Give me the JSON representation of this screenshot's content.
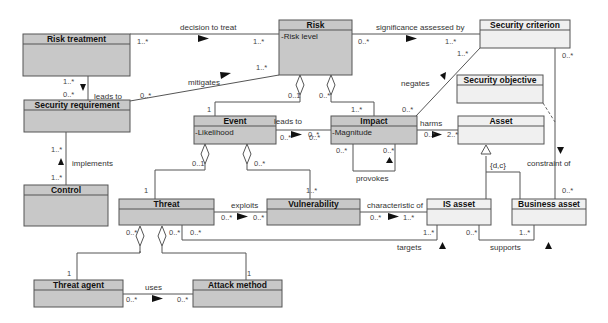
{
  "diagram": {
    "type": "UML class diagram",
    "colors": {
      "dark_class": "#c8c8c8",
      "light_class": "#f0f0f0",
      "border": "#555555",
      "line": "#555555"
    },
    "classes": [
      {
        "id": "risk_treatment",
        "name": "Risk treatment",
        "attr": "",
        "shade": "dark",
        "x": 23,
        "y": 34,
        "w": 107,
        "h": 42
      },
      {
        "id": "risk",
        "name": "Risk",
        "attr": "-Risk level",
        "shade": "dark",
        "x": 279,
        "y": 20,
        "w": 73,
        "h": 55
      },
      {
        "id": "security_criterion",
        "name": "Security criterion",
        "attr": "",
        "shade": "light",
        "x": 480,
        "y": 20,
        "w": 90,
        "h": 28
      },
      {
        "id": "security_requirement",
        "name": "Security requirement",
        "attr": "",
        "shade": "dark",
        "x": 24,
        "y": 100,
        "w": 106,
        "h": 32
      },
      {
        "id": "security_objective",
        "name": "Security objective",
        "attr": "",
        "shade": "light",
        "x": 457,
        "y": 75,
        "w": 86,
        "h": 28
      },
      {
        "id": "event",
        "name": "Event",
        "attr": "-Likelihood",
        "shade": "dark",
        "x": 194,
        "y": 116,
        "w": 82,
        "h": 28
      },
      {
        "id": "impact",
        "name": "Impact",
        "attr": "-Magnitude",
        "shade": "dark",
        "x": 331,
        "y": 116,
        "w": 86,
        "h": 28
      },
      {
        "id": "asset",
        "name": "Asset",
        "attr": "",
        "shade": "light",
        "x": 458,
        "y": 116,
        "w": 86,
        "h": 28
      },
      {
        "id": "control",
        "name": "Control",
        "attr": "",
        "shade": "dark",
        "x": 24,
        "y": 185,
        "w": 84,
        "h": 41
      },
      {
        "id": "threat",
        "name": "Threat",
        "attr": "",
        "shade": "dark",
        "x": 119,
        "y": 199,
        "w": 95,
        "h": 26
      },
      {
        "id": "vulnerability",
        "name": "Vulnerability",
        "attr": "",
        "shade": "dark",
        "x": 267,
        "y": 199,
        "w": 93,
        "h": 26
      },
      {
        "id": "is_asset",
        "name": "IS asset",
        "attr": "",
        "shade": "light",
        "x": 427,
        "y": 199,
        "w": 64,
        "h": 26
      },
      {
        "id": "business_asset",
        "name": "Business asset",
        "attr": "",
        "shade": "light",
        "x": 512,
        "y": 199,
        "w": 74,
        "h": 26
      },
      {
        "id": "threat_agent",
        "name": "Threat agent",
        "attr": "",
        "shade": "dark",
        "x": 34,
        "y": 280,
        "w": 89,
        "h": 27
      },
      {
        "id": "attack_method",
        "name": "Attack method",
        "attr": "",
        "shade": "dark",
        "x": 193,
        "y": 280,
        "w": 89,
        "h": 27
      }
    ],
    "associations": [
      {
        "label": "decision to treat",
        "from": "Risk treatment",
        "to": "Risk",
        "m1": "1..*",
        "m2": "1..*"
      },
      {
        "label": "significance assessed by",
        "from": "Risk",
        "to": "Security criterion",
        "m1": "0..*",
        "m2": "1..*"
      },
      {
        "label": "mitigates",
        "from": "Security requirement",
        "to": "Risk",
        "m1": "0..*",
        "m2": "1..*"
      },
      {
        "label": "leads to",
        "from": "Risk treatment",
        "to": "Security requirement",
        "m1": "1..*",
        "m2": "0..*"
      },
      {
        "label": "implements",
        "from": "Control",
        "to": "Security requirement",
        "m1": "1..*",
        "m2": "1..*"
      },
      {
        "label": "negates",
        "from": "Impact",
        "to": "Security criterion",
        "m1": "0..*",
        "m2": "1..*"
      },
      {
        "label": "leads to",
        "from": "Event",
        "to": "Impact",
        "m1": "0..*",
        "m2": "0..*"
      },
      {
        "label": "harms",
        "from": "Impact",
        "to": "Asset",
        "m1": "0..*",
        "m2": "2..*"
      },
      {
        "label": "provokes",
        "from": "Impact",
        "to": "Impact",
        "m1": "0..*",
        "m2": "0..*"
      },
      {
        "label": "constraint of",
        "from": "Security criterion",
        "to": "Business asset",
        "m1": "0..*",
        "m2": "0..*"
      },
      {
        "label": "exploits",
        "from": "Threat",
        "to": "Vulnerability",
        "m1": "0..*",
        "m2": "0..*"
      },
      {
        "label": "characteristic of",
        "from": "Vulnerability",
        "to": "IS asset",
        "m1": "0..*",
        "m2": "1..*"
      },
      {
        "label": "targets",
        "from": "Threat",
        "to": "IS asset",
        "m1": "0..*",
        "m2": "1..*"
      },
      {
        "label": "supports",
        "from": "IS asset",
        "to": "Business asset",
        "m1": "0..*",
        "m2": "1..*"
      },
      {
        "label": "uses",
        "from": "Threat agent",
        "to": "Attack method",
        "m1": "0..*",
        "m2": "0..*"
      }
    ],
    "aggregations": [
      {
        "whole": "Risk",
        "part": "Event",
        "m_whole": "0..1",
        "m_part": "1"
      },
      {
        "whole": "Risk",
        "part": "Impact",
        "m_whole": "0..*",
        "m_part": "1..*"
      },
      {
        "whole": "Event",
        "part": "Threat",
        "m_whole": "0..1",
        "m_part": "1"
      },
      {
        "whole": "Event",
        "part": "Vulnerability",
        "m_whole": "0..*",
        "m_part": "1..*"
      },
      {
        "whole": "Threat",
        "part": "Threat agent",
        "m_whole": "0..*",
        "m_part": "1"
      },
      {
        "whole": "Threat",
        "part": "Attack method",
        "m_whole": "0..*",
        "m_part": "1"
      }
    ],
    "generalization": {
      "parent": "Asset",
      "children": [
        "IS asset",
        "Business asset"
      ],
      "constraint": "{d,c}"
    }
  },
  "labels": {
    "decision_to_treat": "decision to treat",
    "significance": "significance assessed by",
    "mitigates": "mitigates",
    "leads_to_1": "leads to",
    "implements": "implements",
    "negates": "negates",
    "leads_to_2": "leads to",
    "harms": "harms",
    "provokes": "provokes",
    "constraint_of": "constraint of",
    "exploits": "exploits",
    "characteristic_of": "characteristic of",
    "targets": "targets",
    "supports": "supports",
    "uses": "uses",
    "gen_constraint": "{d,c}"
  },
  "mult": {
    "one_star": "1..*",
    "zero_star": "0..*",
    "zero_one": "0..1",
    "one": "1",
    "two_star": "2..*"
  }
}
